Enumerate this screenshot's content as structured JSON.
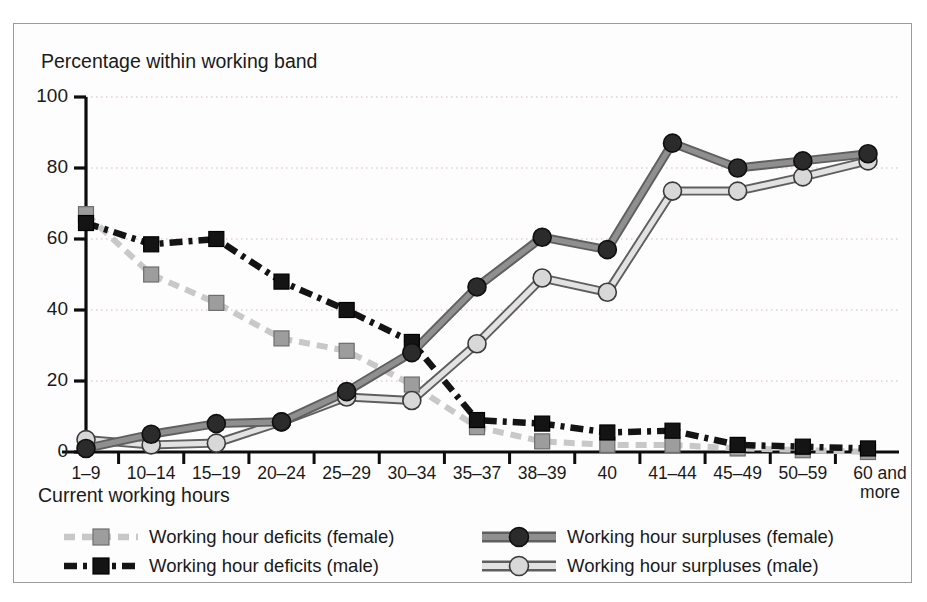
{
  "chart_data": {
    "type": "line",
    "title": "",
    "ylabel": "Percentage within working band",
    "xlabel": "Current working hours",
    "ylim": [
      0,
      100
    ],
    "yticks": [
      0,
      20,
      40,
      60,
      80,
      100
    ],
    "grid": "horizontal-dotted",
    "legend_position": "bottom",
    "categories": [
      "1–9",
      "10–14",
      "15–19",
      "20–24",
      "25–29",
      "30–34",
      "35–37",
      "38–39",
      "40",
      "41–44",
      "45–49",
      "50–59",
      "60 and more"
    ],
    "series": [
      {
        "name": "Working hour deficits (female)",
        "key": "deficits_female",
        "marker": "square",
        "marker_fill": "#9d9d9d",
        "line_color": "#c8c8c8",
        "line_style": "dashed",
        "values": [
          67,
          50,
          42,
          32,
          28.5,
          19,
          7,
          3,
          2,
          2,
          1,
          0.5,
          0
        ]
      },
      {
        "name": "Working hour deficits (male)",
        "key": "deficits_male",
        "marker": "square",
        "marker_fill": "#141414",
        "line_color": "#141414",
        "line_style": "dash-dot",
        "values": [
          64.5,
          58.5,
          60,
          48,
          40,
          31,
          9,
          8,
          5.5,
          6,
          2,
          1.5,
          1
        ]
      },
      {
        "name": "Working hour surpluses (female)",
        "key": "surpluses_female",
        "marker": "circle",
        "marker_fill": "#2b2b2b",
        "line_color": "#8a8a8a",
        "line_style": "solid",
        "values": [
          1,
          5,
          8,
          8.5,
          17,
          28,
          46.5,
          60.5,
          57,
          87,
          80,
          82,
          84
        ]
      },
      {
        "name": "Working hour surpluses (male)",
        "key": "surpluses_male",
        "marker": "circle",
        "marker_fill": "#d8d8d8",
        "line_color": "#8a8a8a",
        "line_style": "solid",
        "values": [
          3.5,
          2,
          2.5,
          8.5,
          15.5,
          14.5,
          30.5,
          49,
          45,
          73.5,
          73.5,
          77.5,
          82
        ]
      }
    ]
  },
  "axes": {
    "y_title": "Percentage within working band",
    "x_title": "Current working hours",
    "y_tick_labels": [
      "100",
      "80",
      "60",
      "40",
      "20",
      "0"
    ],
    "x_tick_labels": [
      "1–9",
      "10–14",
      "15–19",
      "20–24",
      "25–29",
      "30–34",
      "35–37",
      "38–39",
      "40",
      "41–44",
      "45–49",
      "50–59",
      "60 and"
    ],
    "x_tick_last_line2": "more"
  },
  "legend": {
    "items": [
      {
        "label": "Working hour deficits (female)",
        "key": "deficits_female"
      },
      {
        "label": "Working hour deficits (male)",
        "key": "deficits_male"
      },
      {
        "label": "Working hour surpluses (female)",
        "key": "surpluses_female"
      },
      {
        "label": "Working hour surpluses (male)",
        "key": "surpluses_male"
      }
    ]
  },
  "colors": {
    "frame_border": "#9a9a9a",
    "axis": "#0d0d0d",
    "grid": "#d9b8b8",
    "text": "#1a1a1a",
    "dark_marker": "#2b2b2b",
    "light_marker": "#d8d8d8",
    "grey_marker": "#9d9d9d",
    "black_marker": "#141414",
    "line_grey": "#8a8a8a",
    "line_light": "#c8c8c8"
  }
}
